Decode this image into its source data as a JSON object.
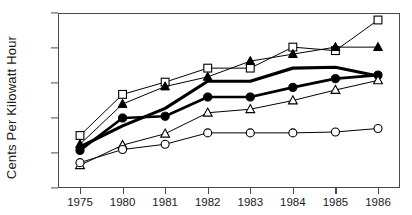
{
  "chart_data": {
    "type": "line",
    "title": "",
    "xlabel": "",
    "ylabel": "Cents Per Kilowatt Hour",
    "categories": [
      "1975",
      "1980",
      "1981",
      "1982",
      "1983",
      "1984",
      "1985",
      "1986"
    ],
    "ylim": [
      2,
      12
    ],
    "yticks": [
      2,
      4,
      6,
      8,
      10,
      12
    ],
    "grid": false,
    "legend": "none",
    "series": [
      {
        "name": "open-square",
        "marker": "open-square",
        "color": "#000000",
        "line_width": 1,
        "values": [
          5.0,
          7.35,
          8.05,
          8.85,
          8.85,
          10.05,
          9.85,
          11.6
        ]
      },
      {
        "name": "filled-triangle",
        "marker": "filled-triangle",
        "color": "#000000",
        "line_width": 1,
        "values": [
          4.5,
          6.8,
          7.8,
          8.35,
          9.25,
          9.65,
          10.05,
          10.05
        ]
      },
      {
        "name": "thick-line",
        "marker": "none",
        "color": "#000000",
        "line_width": 3.2,
        "values": [
          4.35,
          5.55,
          6.55,
          8.1,
          8.1,
          8.85,
          8.9,
          8.4
        ]
      },
      {
        "name": "filled-circle",
        "marker": "filled-circle",
        "color": "#000000",
        "line_width": 2.6,
        "values": [
          4.15,
          6.0,
          6.1,
          7.2,
          7.2,
          7.75,
          8.25,
          8.45
        ]
      },
      {
        "name": "open-triangle",
        "marker": "open-triangle",
        "color": "#000000",
        "line_width": 1,
        "values": [
          3.3,
          4.45,
          5.1,
          6.3,
          6.5,
          7.0,
          7.6,
          8.15
        ]
      },
      {
        "name": "open-circle",
        "marker": "open-circle",
        "color": "#000000",
        "line_width": 1,
        "values": [
          3.45,
          4.2,
          4.5,
          5.15,
          5.15,
          5.15,
          5.2,
          5.4
        ]
      }
    ]
  }
}
